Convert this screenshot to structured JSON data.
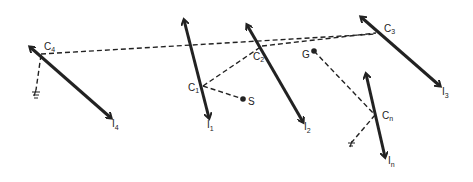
{
  "diagram": {
    "colors": {
      "stroke": "#222222",
      "background": "#ffffff"
    },
    "arrows": [
      {
        "id": "I4",
        "x1": 30,
        "y1": 47,
        "x2": 111,
        "y2": 118,
        "contact": "C4"
      },
      {
        "id": "I1",
        "x1": 184,
        "y1": 20,
        "x2": 209,
        "y2": 118,
        "contact": "C1"
      },
      {
        "id": "I2",
        "x1": 247,
        "y1": 25,
        "x2": 303,
        "y2": 122,
        "contact": "C2"
      },
      {
        "id": "I3",
        "x1": 361,
        "y1": 17,
        "x2": 440,
        "y2": 86,
        "contact": "C3"
      },
      {
        "id": "In",
        "x1": 366,
        "y1": 74,
        "x2": 385,
        "y2": 157,
        "contact": "Cn"
      }
    ],
    "labels": {
      "c4": {
        "main": "C",
        "sub": "4"
      },
      "c1": {
        "main": "C",
        "sub": "1"
      },
      "c2": {
        "main": "C",
        "sub": "2"
      },
      "c3": {
        "main": "C",
        "sub": "3"
      },
      "cn": {
        "main": "C",
        "sub": "n"
      },
      "i4": {
        "main": "I",
        "sub": "4"
      },
      "i1": {
        "main": "I",
        "sub": "1"
      },
      "i2": {
        "main": "I",
        "sub": "2"
      },
      "i3": {
        "main": "I",
        "sub": "3"
      },
      "in": {
        "main": "I",
        "sub": "n"
      },
      "s": "S",
      "g": "G"
    },
    "points": {
      "S": {
        "x": 243,
        "y": 99
      },
      "G": {
        "x": 314,
        "y": 51
      }
    }
  }
}
